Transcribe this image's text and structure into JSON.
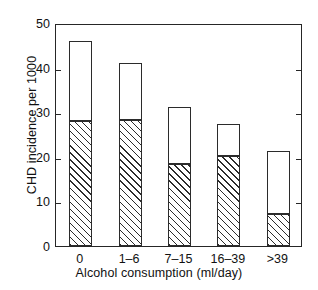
{
  "chart_data": {
    "type": "bar",
    "title": "",
    "subtitle": "",
    "xlabel": "Alcohol consumption (ml/day)",
    "ylabel": "CHD incidence per 1000",
    "categories": [
      "0",
      "1–6",
      "7–15",
      "16–39",
      ">39"
    ],
    "ylim": [
      0,
      50
    ],
    "yticks": [
      0,
      10,
      20,
      30,
      40,
      50
    ],
    "ytick_labels": [
      "0",
      "10",
      "20",
      "30",
      "40",
      "50"
    ],
    "grid": false,
    "legend": "none",
    "stacked": true,
    "series": [
      {
        "name": "hatched lower segment",
        "fill": "diagonal-hatch",
        "values": [
          28,
          28.3,
          18.5,
          20.2,
          7.1
        ]
      },
      {
        "name": "open upper segment",
        "fill": "white",
        "values": [
          18,
          12.7,
          12.7,
          7.2,
          14.3
        ]
      }
    ],
    "totals": [
      46,
      41,
      31.2,
      27.4,
      21.4
    ],
    "colors": {
      "axis": "#262626",
      "bar_outline": "#2b2b2b",
      "hatch": "#2b2b2b",
      "background": "#ffffff"
    }
  }
}
